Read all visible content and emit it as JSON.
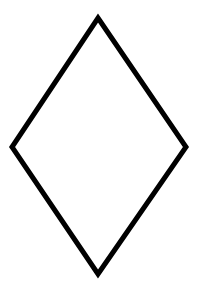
{
  "figure": {
    "shape": "rhombus",
    "stroke_color": "#000000",
    "fill_color": "#ffffff",
    "background_color": "#ffffff"
  },
  "top_text_fragments": {
    "left": "",
    "right": ""
  }
}
